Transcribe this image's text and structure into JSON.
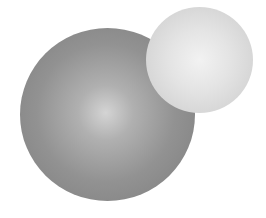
{
  "scene": {
    "description": "Two shaded spheres on white background",
    "background": "#ffffff",
    "spheres": [
      {
        "name": "large-dark-sphere",
        "center": [
          107,
          114
        ],
        "radius": 87,
        "highlight": "#d4d4d4",
        "edge": "#7c7c7c"
      },
      {
        "name": "small-light-sphere",
        "center": [
          199,
          60
        ],
        "radius": 53,
        "highlight": "#f2f2f2",
        "edge": "#c9c9c9"
      }
    ]
  }
}
